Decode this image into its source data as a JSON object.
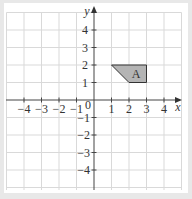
{
  "diagram": {
    "type": "coordinate-grid",
    "axes": {
      "x_label": "x",
      "y_label": "y",
      "origin_label": "0",
      "x_ticks": [
        "−4",
        "−3",
        "−2",
        "−1",
        "1",
        "2",
        "3",
        "4"
      ],
      "y_ticks": [
        "4",
        "3",
        "2",
        "1",
        "−1",
        "−2",
        "−3",
        "−4"
      ],
      "x_range": [
        -5,
        5
      ],
      "y_range": [
        -5,
        5
      ]
    },
    "shapes": [
      {
        "label": "A",
        "vertices": [
          [
            1,
            2
          ],
          [
            3,
            2
          ],
          [
            3,
            1
          ],
          [
            2,
            1
          ]
        ],
        "fill": "#b4b4b4",
        "stroke": "#333333"
      }
    ],
    "colors": {
      "grid": "#d9d9d9",
      "axis": "#444444",
      "border": "#e8e8e8"
    }
  }
}
